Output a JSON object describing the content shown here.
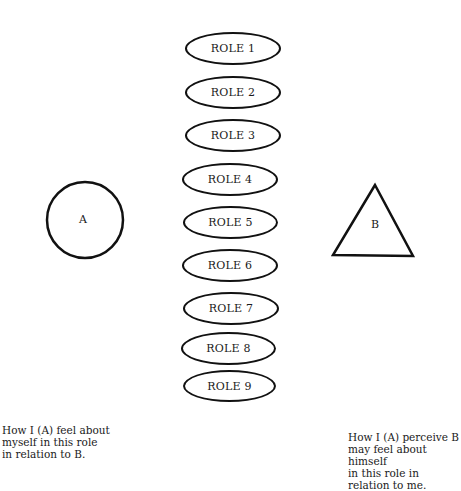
{
  "roles": [
    {
      "label": "ROLE 1"
    },
    {
      "label": "ROLE 2"
    },
    {
      "label": "ROLE 3"
    },
    {
      "label": "ROLE 4"
    },
    {
      "label": "ROLE 5"
    },
    {
      "label": "ROLE 6"
    },
    {
      "label": "ROLE 7"
    },
    {
      "label": "ROLE 8"
    },
    {
      "label": "ROLE 9"
    }
  ],
  "person_a": {
    "label": "A",
    "shape": "circle"
  },
  "person_b": {
    "label": "B",
    "shape": "triangle"
  },
  "captions": {
    "left": "How I (A) feel about\nmyself in this role\nin relation to B.",
    "right": "How I (A) perceive B\nmay feel about himself\nin this role in\nrelation to me."
  },
  "colors": {
    "stroke": "#111111",
    "background": "#ffffff"
  }
}
